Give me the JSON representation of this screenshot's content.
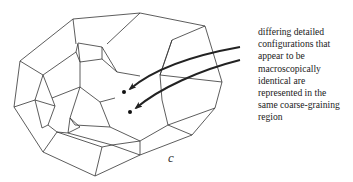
{
  "figure": {
    "caption_lines": [
      "differing detailed",
      "configurations that",
      "appear to be",
      "macroscopically",
      "identical are",
      "represented in the",
      "same coarse-graining",
      "region"
    ],
    "region_label": "c",
    "points": [
      {
        "name": "configuration-point-1",
        "x": 124,
        "y": 92
      },
      {
        "name": "configuration-point-2",
        "x": 130,
        "y": 112
      }
    ],
    "colors": {
      "line": "#333333",
      "arrow": "#222222",
      "background": "#ffffff"
    }
  }
}
